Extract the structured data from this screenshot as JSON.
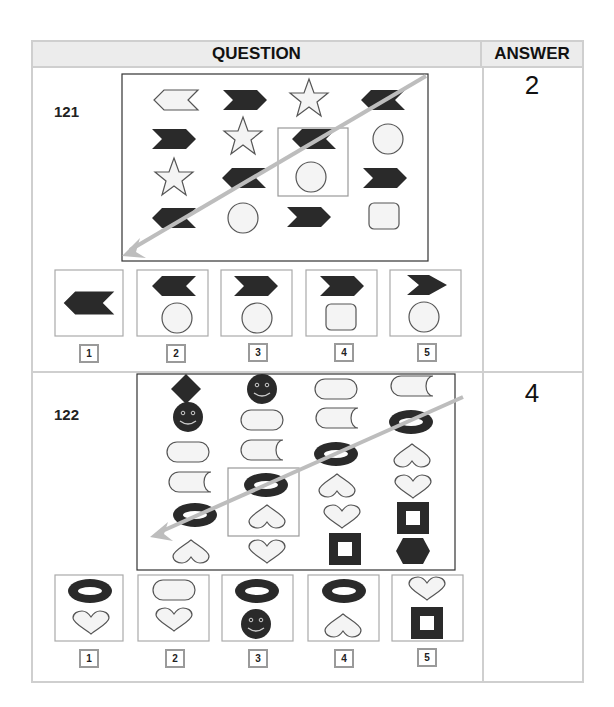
{
  "header": {
    "question": "QUESTION",
    "answer": "ANSWER"
  },
  "colors": {
    "dark": "#2a2a2a",
    "light_fill": "#f4f4f4",
    "outline": "#555555",
    "arrow": "#bdbdbd",
    "border": "#cfcfcf",
    "header_bg": "#ececec"
  },
  "questions": [
    {
      "number": "121",
      "answer": "2",
      "grid": [
        [
          "chevron-left-outline",
          "chevron-right-dark",
          "star-outline",
          "chevron-left-dark"
        ],
        [
          "chevron-right-dark",
          "star-outline",
          "chevron-left-dark",
          "circle-outline"
        ],
        [
          "star-outline",
          "chevron-left-dark",
          "circle-outline",
          "chevron-right-dark"
        ],
        [
          "chevron-left-dark",
          "circle-outline",
          "chevron-right-dark",
          "rounded-square-outline"
        ]
      ],
      "highlight": "column 3, rows 2-3 (missing pair)",
      "options": [
        {
          "label": "1",
          "shapes": [
            "chevron-left-dark"
          ]
        },
        {
          "label": "2",
          "shapes": [
            "chevron-left-dark",
            "circle-outline"
          ]
        },
        {
          "label": "3",
          "shapes": [
            "chevron-right-dark",
            "circle-outline"
          ]
        },
        {
          "label": "4",
          "shapes": [
            "chevron-right-dark",
            "rounded-square-outline"
          ]
        },
        {
          "label": "5",
          "shapes": [
            "chevron-right-dark-thin",
            "circle-outline"
          ]
        }
      ]
    },
    {
      "number": "122",
      "answer": "4",
      "grid": [
        [
          "diamond-dark",
          "smiley-dark",
          "pill-outline",
          "pill-notched-outline"
        ],
        [
          "smiley-dark",
          "pill-outline",
          "pill-notched-outline",
          "ring-dark"
        ],
        [
          "pill-outline",
          "pill-notched-outline",
          "ring-dark",
          "heart-inverted-outline"
        ],
        [
          "pill-notched-outline",
          "ring-dark",
          "heart-inverted-outline",
          "heart-outline"
        ],
        [
          "ring-dark",
          "heart-inverted-outline",
          "heart-outline",
          "square-frame-dark"
        ],
        [
          "heart-inverted-outline",
          "heart-outline",
          "square-frame-dark",
          "hexagon-dark"
        ]
      ],
      "highlight": "column 2, rows 4-5 (missing pair)",
      "options": [
        {
          "label": "1",
          "shapes": [
            "ring-dark",
            "heart-outline"
          ]
        },
        {
          "label": "2",
          "shapes": [
            "pill-outline",
            "heart-outline"
          ]
        },
        {
          "label": "3",
          "shapes": [
            "ring-dark",
            "smiley-dark"
          ]
        },
        {
          "label": "4",
          "shapes": [
            "ring-dark",
            "heart-inverted-outline"
          ]
        },
        {
          "label": "5",
          "shapes": [
            "heart-outline",
            "square-frame-dark"
          ]
        }
      ]
    }
  ]
}
